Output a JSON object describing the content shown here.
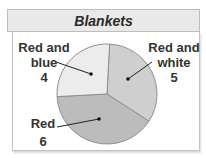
{
  "chart_data": {
    "type": "pie",
    "title": "Blankets",
    "categories": [
      "Red and white",
      "Red",
      "Red and blue"
    ],
    "values": [
      5,
      6,
      4
    ],
    "colors": [
      "#cfcfcf",
      "#bcbcbc",
      "#ececec"
    ],
    "labels": [
      {
        "name": "Red and white",
        "line1": "Red and",
        "line2": "white",
        "value": "5"
      },
      {
        "name": "Red",
        "line1": "Red",
        "line2": "",
        "value": "6"
      },
      {
        "name": "Red and blue",
        "line1": "Red and",
        "line2": "blue",
        "value": "4"
      }
    ]
  },
  "header": {
    "title": "Blankets"
  }
}
